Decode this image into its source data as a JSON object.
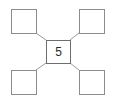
{
  "diagram": {
    "type": "star-node-diagram",
    "canvas": {
      "width": 115,
      "height": 101,
      "background": "#ffffff"
    },
    "style": {
      "node_stroke": "#8c8c8c",
      "center_node_stroke": "#6e6e6e",
      "connector_stroke": "#9a9a9a",
      "node_fill": "#ffffff",
      "label_color": "#2b2b2b",
      "node_stroke_width": 1,
      "connector_stroke_width": 1
    },
    "center_node": {
      "name": "center-node",
      "label": "5",
      "x": 46,
      "y": 40,
      "width": 24,
      "height": 23
    },
    "corner_nodes": [
      {
        "name": "top-left-node",
        "label": "",
        "x": 11,
        "y": 9,
        "width": 25,
        "height": 24
      },
      {
        "name": "top-right-node",
        "label": "",
        "x": 79,
        "y": 9,
        "width": 25,
        "height": 24
      },
      {
        "name": "bottom-left-node",
        "label": "",
        "x": 11,
        "y": 70,
        "width": 25,
        "height": 24
      },
      {
        "name": "bottom-right-node",
        "label": "",
        "x": 79,
        "y": 70,
        "width": 25,
        "height": 24
      }
    ],
    "connectors": [
      {
        "name": "connector-top-left",
        "x1": 36,
        "y1": 33,
        "x2": 46,
        "y2": 40
      },
      {
        "name": "connector-top-right",
        "x1": 79,
        "y1": 33,
        "x2": 70,
        "y2": 40
      },
      {
        "name": "connector-bottom-left",
        "x1": 36,
        "y1": 70,
        "x2": 46,
        "y2": 63
      },
      {
        "name": "connector-bottom-right",
        "x1": 79,
        "y1": 70,
        "x2": 70,
        "y2": 63
      }
    ]
  }
}
